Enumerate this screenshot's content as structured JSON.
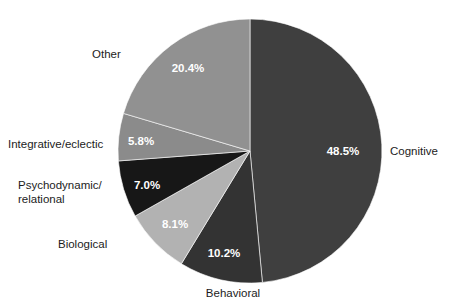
{
  "chart_data": {
    "type": "pie",
    "title": "",
    "subtitle": "",
    "xlabel": "",
    "ylabel": "",
    "legend_position": "none",
    "grid": false,
    "units": "percent",
    "start_angle_deg": 0,
    "direction": "clockwise",
    "categories": [
      "Cognitive",
      "Behavioral",
      "Biological",
      "Psychodynamic/\nrelational",
      "Integrative/eclectic",
      "Other"
    ],
    "values": [
      48.5,
      10.2,
      8.1,
      7.0,
      5.8,
      20.4
    ],
    "value_labels": [
      "48.5%",
      "10.2%",
      "8.1%",
      "7.0%",
      "5.8%",
      "20.4%"
    ],
    "colors": [
      "#3f3f3f",
      "#333333",
      "#b2b2b2",
      "#171717",
      "#8b8b8b",
      "#919191"
    ],
    "slices": [
      {
        "name": "Cognitive",
        "label": "Cognitive",
        "value": 48.5,
        "value_label": "48.5%",
        "color": "#3f3f3f",
        "value_label_color": "#ffffff",
        "start_deg": 0.0,
        "end_deg": 174.6
      },
      {
        "name": "Behavioral",
        "label": "Behavioral",
        "value": 10.2,
        "value_label": "10.2%",
        "color": "#333333",
        "value_label_color": "#ffffff",
        "start_deg": 174.6,
        "end_deg": 211.32
      },
      {
        "name": "Biological",
        "label": "Biological",
        "value": 8.1,
        "value_label": "8.1%",
        "color": "#b2b2b2",
        "value_label_color": "#ffffff",
        "start_deg": 211.32,
        "end_deg": 240.48
      },
      {
        "name": "Psychodynamic/relational",
        "label": "Psychodynamic/\nrelational",
        "value": 7.0,
        "value_label": "7.0%",
        "color": "#171717",
        "value_label_color": "#ffffff",
        "start_deg": 240.48,
        "end_deg": 265.68
      },
      {
        "name": "Integrative/eclectic",
        "label": "Integrative/eclectic",
        "value": 5.8,
        "value_label": "5.8%",
        "color": "#8b8b8b",
        "value_label_color": "#ffffff",
        "start_deg": 265.68,
        "end_deg": 286.56
      },
      {
        "name": "Other",
        "label": "Other",
        "value": 20.4,
        "value_label": "20.4%",
        "color": "#919191",
        "value_label_color": "#ffffff",
        "start_deg": 286.56,
        "end_deg": 360.0
      }
    ]
  },
  "geometry": {
    "center_x": 250,
    "center_y": 151,
    "radius": 132,
    "value_label_radius_fraction": 0.72
  },
  "category_label_positions": [
    {
      "name": "Cognitive",
      "x": 390,
      "y": 144,
      "align": "cat-right",
      "width": 75
    },
    {
      "name": "Behavioral",
      "x": 193,
      "y": 286,
      "align": "cat-center",
      "width": 80
    },
    {
      "name": "Biological",
      "x": 58,
      "y": 237,
      "align": "cat-right",
      "width": 70
    },
    {
      "name": "Psychodynamic/relational",
      "x": 18,
      "y": 178,
      "align": "cat-right",
      "width": 108
    },
    {
      "name": "Integrative/eclectic",
      "x": 8,
      "y": 137,
      "align": "cat-right",
      "width": 116
    },
    {
      "name": "Other",
      "x": 92,
      "y": 47,
      "align": "cat-right",
      "width": 48
    }
  ],
  "value_label_positions": [
    {
      "name": "Cognitive",
      "x": 343,
      "y": 152
    },
    {
      "name": "Behavioral",
      "x": 224,
      "y": 254
    },
    {
      "name": "Biological",
      "x": 175,
      "y": 225
    },
    {
      "name": "Psychodynamic/relational",
      "x": 147,
      "y": 186
    },
    {
      "name": "Integrative/eclectic",
      "x": 141,
      "y": 142
    },
    {
      "name": "Other",
      "x": 188,
      "y": 69
    }
  ],
  "background_color": "#ffffff"
}
